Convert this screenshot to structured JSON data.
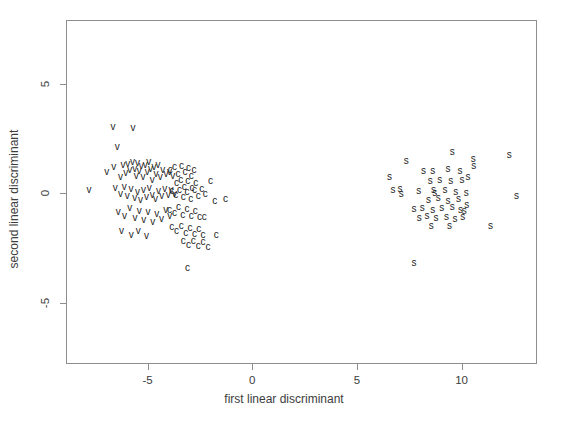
{
  "chart_data": {
    "type": "scatter",
    "title": "",
    "xlabel": "first linear discriminant",
    "ylabel": "second linear discriminant",
    "xlim": [
      -8.9,
      13.6
    ],
    "ylim": [
      -7.8,
      7.9
    ],
    "xticks": [
      -5,
      0,
      5,
      10
    ],
    "xticklabels": [
      "-5",
      "0",
      "5",
      "10"
    ],
    "yticks": [
      5,
      0,
      -5
    ],
    "yticklabels": [
      "5",
      "0",
      "-5"
    ],
    "grid": false,
    "legend": false,
    "marker_style": "text-glyph",
    "series": [
      {
        "name": "v",
        "label": "v",
        "color": "#1d1d1d",
        "points": [
          [
            -7.8,
            0.14
          ],
          [
            -6.65,
            3.0
          ],
          [
            -5.7,
            2.95
          ],
          [
            -6.45,
            2.11
          ],
          [
            -6.95,
            0.97
          ],
          [
            -6.62,
            1.17
          ],
          [
            -6.3,
            0.74
          ],
          [
            -6.18,
            1.26
          ],
          [
            -6.05,
            0.9
          ],
          [
            -5.95,
            1.33
          ],
          [
            -5.86,
            1.05
          ],
          [
            -5.72,
            1.42
          ],
          [
            -5.62,
            1.1
          ],
          [
            -5.55,
            0.8
          ],
          [
            -5.48,
            1.38
          ],
          [
            -5.4,
            1.02
          ],
          [
            -5.3,
            1.25
          ],
          [
            -5.22,
            0.72
          ],
          [
            -5.12,
            1.3
          ],
          [
            -5.02,
            0.95
          ],
          [
            -4.95,
            1.4
          ],
          [
            -4.86,
            1.08
          ],
          [
            -4.78,
            0.62
          ],
          [
            -4.7,
            1.18
          ],
          [
            -4.6,
            0.85
          ],
          [
            -4.5,
            1.3
          ],
          [
            -4.4,
            0.72
          ],
          [
            -4.28,
            1.05
          ],
          [
            -4.12,
            0.88
          ],
          [
            -3.96,
            0.95
          ],
          [
            -3.8,
            0.78
          ],
          [
            -6.55,
            0.22
          ],
          [
            -6.3,
            -0.05
          ],
          [
            -6.12,
            0.3
          ],
          [
            -5.98,
            -0.12
          ],
          [
            -5.8,
            0.18
          ],
          [
            -5.62,
            -0.22
          ],
          [
            -5.48,
            0.05
          ],
          [
            -5.34,
            -0.3
          ],
          [
            -5.2,
            0.12
          ],
          [
            -5.06,
            -0.18
          ],
          [
            -4.92,
            0.25
          ],
          [
            -4.78,
            -0.08
          ],
          [
            -4.62,
            -0.28
          ],
          [
            -4.48,
            0.1
          ],
          [
            -4.32,
            -0.15
          ],
          [
            -4.18,
            0.2
          ],
          [
            -4.02,
            -0.1
          ],
          [
            -3.88,
            0.15
          ],
          [
            -3.72,
            -0.05
          ],
          [
            -6.4,
            -0.85
          ],
          [
            -6.1,
            -1.05
          ],
          [
            -5.85,
            -0.7
          ],
          [
            -5.6,
            -1.15
          ],
          [
            -5.4,
            -0.82
          ],
          [
            -5.18,
            -1.22
          ],
          [
            -4.98,
            -0.88
          ],
          [
            -4.76,
            -1.3
          ],
          [
            -4.56,
            -0.95
          ],
          [
            -4.34,
            -1.18
          ],
          [
            -4.14,
            -0.78
          ],
          [
            -3.94,
            -1.05
          ],
          [
            -6.25,
            -1.75
          ],
          [
            -5.78,
            -1.92
          ],
          [
            -5.45,
            -1.72
          ],
          [
            -5.05,
            -1.98
          ]
        ]
      },
      {
        "name": "c",
        "label": "c",
        "color": "#1d1d1d",
        "points": [
          [
            -3.92,
            1.05
          ],
          [
            -3.72,
            1.18
          ],
          [
            -3.55,
            0.88
          ],
          [
            -3.38,
            1.22
          ],
          [
            -3.22,
            0.95
          ],
          [
            -3.05,
            1.15
          ],
          [
            -2.92,
            0.78
          ],
          [
            -2.78,
            1.05
          ],
          [
            -3.62,
            0.45
          ],
          [
            -3.42,
            0.62
          ],
          [
            -3.25,
            0.3
          ],
          [
            -3.08,
            0.55
          ],
          [
            -2.88,
            0.25
          ],
          [
            -2.7,
            0.48
          ],
          [
            -3.85,
            0.08
          ],
          [
            -3.66,
            -0.1
          ],
          [
            -3.48,
            0.15
          ],
          [
            -3.3,
            -0.18
          ],
          [
            -3.12,
            0.05
          ],
          [
            -2.94,
            -0.25
          ],
          [
            -2.76,
            0.12
          ],
          [
            -2.58,
            -0.12
          ],
          [
            -2.42,
            0.18
          ],
          [
            -2.25,
            -0.05
          ],
          [
            -3.95,
            -0.75
          ],
          [
            -3.72,
            -0.92
          ],
          [
            -3.52,
            -0.65
          ],
          [
            -3.32,
            -1.0
          ],
          [
            -3.12,
            -0.72
          ],
          [
            -2.92,
            -1.05
          ],
          [
            -2.72,
            -0.8
          ],
          [
            -2.52,
            -1.1
          ],
          [
            -3.85,
            -1.55
          ],
          [
            -3.62,
            -1.75
          ],
          [
            -3.4,
            -1.48
          ],
          [
            -3.18,
            -1.82
          ],
          [
            -2.98,
            -1.58
          ],
          [
            -2.76,
            -1.88
          ],
          [
            -2.56,
            -1.62
          ],
          [
            -2.36,
            -1.92
          ],
          [
            -3.3,
            -2.2
          ],
          [
            -3.05,
            -2.35
          ],
          [
            -2.82,
            -2.18
          ],
          [
            -2.58,
            -2.42
          ],
          [
            -2.35,
            -2.25
          ],
          [
            -2.12,
            -2.45
          ],
          [
            -2.0,
            0.55
          ],
          [
            -1.8,
            -0.35
          ],
          [
            -1.28,
            -0.28
          ],
          [
            -2.3,
            -1.1
          ],
          [
            -1.72,
            -1.92
          ],
          [
            -3.1,
            -3.4
          ]
        ]
      },
      {
        "name": "s",
        "label": "s",
        "color": "#1d1d1d",
        "points": [
          [
            7.35,
            1.45
          ],
          [
            8.18,
            1.02
          ],
          [
            8.62,
            1.02
          ],
          [
            9.55,
            1.88
          ],
          [
            10.55,
            1.55
          ],
          [
            10.58,
            1.22
          ],
          [
            12.28,
            1.72
          ],
          [
            6.55,
            0.72
          ],
          [
            9.35,
            1.08
          ],
          [
            9.92,
            1.02
          ],
          [
            10.3,
            0.72
          ],
          [
            8.5,
            0.55
          ],
          [
            8.95,
            0.58
          ],
          [
            9.48,
            0.55
          ],
          [
            10.02,
            0.58
          ],
          [
            6.72,
            0.12
          ],
          [
            7.05,
            0.18
          ],
          [
            7.12,
            -0.02
          ],
          [
            7.95,
            0.1
          ],
          [
            8.65,
            0.12
          ],
          [
            8.72,
            0.02
          ],
          [
            9.2,
            0.12
          ],
          [
            9.72,
            0.05
          ],
          [
            10.22,
            0.02
          ],
          [
            12.62,
            -0.14
          ],
          [
            8.42,
            -0.32
          ],
          [
            8.88,
            -0.22
          ],
          [
            9.35,
            -0.35
          ],
          [
            9.85,
            -0.28
          ],
          [
            10.25,
            -0.55
          ],
          [
            7.72,
            -0.72
          ],
          [
            8.12,
            -0.68
          ],
          [
            8.62,
            -0.75
          ],
          [
            9.05,
            -0.7
          ],
          [
            9.55,
            -0.62
          ],
          [
            9.95,
            -0.75
          ],
          [
            10.12,
            -0.8
          ],
          [
            7.98,
            -1.12
          ],
          [
            8.35,
            -1.05
          ],
          [
            8.78,
            -1.15
          ],
          [
            9.28,
            -1.08
          ],
          [
            9.68,
            -1.18
          ],
          [
            10.05,
            -1.1
          ],
          [
            8.55,
            -1.5
          ],
          [
            9.42,
            -1.52
          ],
          [
            11.38,
            -1.48
          ],
          [
            7.72,
            -3.2
          ]
        ]
      }
    ]
  },
  "axes": {
    "x_label": "first linear discriminant",
    "y_label": "second linear discriminant",
    "x_tick_labels": [
      "-5",
      "0",
      "5",
      "10"
    ],
    "y_tick_labels": [
      "5",
      "0",
      "-5"
    ]
  },
  "colors": {
    "background": "#ffffff",
    "frame": "#8e8e8e",
    "text": "#3c3c3c",
    "marker": "#1d1d1d"
  }
}
